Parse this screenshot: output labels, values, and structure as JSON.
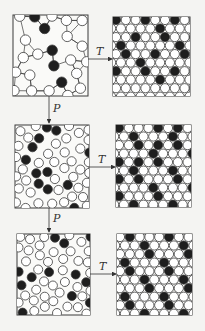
{
  "diagram": {
    "type": "particle-packing-process",
    "labels": {
      "transform": "T",
      "pressure": "P"
    },
    "colors": {
      "background": "#f4f4f2",
      "stroke": "#3a3a3a",
      "filled_particle": "#1e1e1e",
      "empty_particle": "#ffffff"
    },
    "stages": [
      {
        "name": "stage-1",
        "disordered": "loose random packing with bonds",
        "ordered": "lattice with vacant lower rows"
      },
      {
        "name": "stage-2",
        "disordered": "denser random packing",
        "ordered": "hexagonal lattice"
      },
      {
        "name": "stage-3",
        "disordered": "dense random packing",
        "ordered": "close-packed lattice"
      }
    ]
  }
}
